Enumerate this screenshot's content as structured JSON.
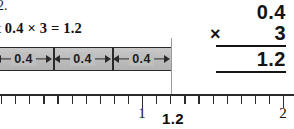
{
  "problem": {
    "number": "2.",
    "equation": {
      "operand_a": "0.4",
      "times_sign": "×",
      "operand_b": "3",
      "equals_sign": "=",
      "product": "1.2",
      "full_text": "t 0.4 × 3 = 1.2"
    }
  },
  "vertical_multiplication": {
    "multiplicand": "0.4",
    "operator": "×",
    "multiplier": "3",
    "product": "1.2"
  },
  "bar_model": {
    "segment_labels": [
      "0.4",
      "0.4",
      "0.4"
    ],
    "segment_count": 3,
    "fill_color": "#bdbdbd",
    "border_color": "#2a2a2a",
    "total_value": "1.2"
  },
  "number_line": {
    "start_value": 0,
    "end_value": 2,
    "minor_tick_step": 0.1,
    "labeled_ticks": [
      {
        "value": 1,
        "label": "1"
      },
      {
        "value": 2,
        "label": "2"
      }
    ],
    "marker": {
      "value": 1.2,
      "label": "1.2"
    },
    "axis_color": "#2b2b2b"
  },
  "chart_data": {
    "type": "bar",
    "title": "",
    "categories": [
      "0.4",
      "0.4",
      "0.4"
    ],
    "values": [
      0.4,
      0.4,
      0.4
    ],
    "xlabel": "",
    "ylabel": "",
    "xlim": [
      0,
      2
    ],
    "annotations": [
      "1.2"
    ]
  }
}
